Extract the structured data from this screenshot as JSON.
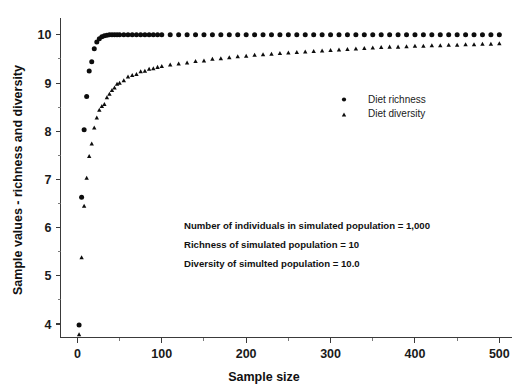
{
  "chart_data": {
    "type": "scatter",
    "title": "",
    "xlabel": "Sample size",
    "ylabel": "Sample values - richness and diversity",
    "xlim": [
      -20,
      515
    ],
    "ylim": [
      3.72,
      10.35
    ],
    "grid": false,
    "legend_position": "upper-right-inside",
    "x_ticks": [
      0,
      100,
      200,
      300,
      400,
      500
    ],
    "x_tick_labels": [
      "0",
      "100",
      "200",
      "300",
      "400",
      "500"
    ],
    "x_minor_ticks": [
      50,
      150,
      250,
      350,
      450
    ],
    "y_ticks": [
      4,
      5,
      6,
      7,
      8,
      9,
      10
    ],
    "y_tick_labels": [
      "4",
      "5",
      "6",
      "7",
      "8",
      "9",
      "10"
    ],
    "y_minor_ticks": [
      4.5,
      5.5,
      6.5,
      7.5,
      8.5,
      9.5
    ],
    "series": [
      {
        "name": "Diet richness",
        "marker": "circle",
        "color": "#0d0d0d",
        "x": [
          2,
          5,
          8,
          11,
          14,
          17,
          20,
          23,
          26,
          29,
          32,
          35,
          38,
          41,
          44,
          47,
          50,
          55,
          60,
          65,
          70,
          75,
          80,
          85,
          90,
          95,
          100,
          110,
          120,
          130,
          140,
          150,
          160,
          170,
          180,
          190,
          200,
          210,
          220,
          230,
          240,
          250,
          260,
          270,
          280,
          290,
          300,
          310,
          320,
          330,
          340,
          350,
          360,
          370,
          380,
          390,
          400,
          410,
          420,
          430,
          440,
          450,
          460,
          470,
          480,
          490,
          500
        ],
        "y": [
          3.98,
          6.63,
          8.03,
          8.72,
          9.25,
          9.44,
          9.71,
          9.85,
          9.92,
          9.96,
          9.98,
          9.99,
          10.0,
          10.0,
          10.0,
          10.0,
          10.0,
          10.0,
          10.0,
          10.0,
          10.0,
          10.0,
          10.0,
          10.0,
          10.0,
          10.0,
          10.0,
          10.0,
          10.0,
          10.0,
          10.0,
          10.0,
          10.0,
          10.0,
          10.0,
          10.0,
          10.0,
          10.0,
          10.0,
          10.0,
          10.0,
          10.0,
          10.0,
          10.0,
          10.0,
          10.0,
          10.0,
          10.0,
          10.0,
          10.0,
          10.0,
          10.0,
          10.0,
          10.0,
          10.0,
          10.0,
          10.0,
          10.0,
          10.0,
          10.0,
          10.0,
          10.0,
          10.0,
          10.0,
          10.0,
          10.0,
          10.0
        ]
      },
      {
        "name": "Diet diversity",
        "marker": "triangle",
        "color": "#0d0d0d",
        "x": [
          2,
          5,
          8,
          11,
          14,
          17,
          20,
          23,
          26,
          29,
          32,
          35,
          38,
          41,
          44,
          47,
          50,
          55,
          60,
          65,
          70,
          75,
          80,
          85,
          90,
          95,
          100,
          110,
          120,
          130,
          140,
          150,
          160,
          170,
          180,
          190,
          200,
          210,
          220,
          230,
          240,
          250,
          260,
          270,
          280,
          290,
          300,
          310,
          320,
          330,
          340,
          350,
          360,
          370,
          380,
          390,
          400,
          410,
          420,
          430,
          440,
          450,
          460,
          470,
          480,
          490,
          500
        ],
        "y": [
          3.78,
          5.38,
          6.45,
          7.03,
          7.48,
          7.74,
          8.07,
          8.28,
          8.44,
          8.52,
          8.56,
          8.7,
          8.77,
          8.85,
          8.9,
          8.98,
          9.0,
          9.05,
          9.13,
          9.16,
          9.18,
          9.24,
          9.25,
          9.29,
          9.3,
          9.33,
          9.35,
          9.38,
          9.4,
          9.42,
          9.45,
          9.46,
          9.5,
          9.51,
          9.53,
          9.55,
          9.56,
          9.58,
          9.59,
          9.6,
          9.62,
          9.63,
          9.64,
          9.65,
          9.66,
          9.67,
          9.68,
          9.69,
          9.7,
          9.71,
          9.72,
          9.73,
          9.74,
          9.75,
          9.75,
          9.76,
          9.77,
          9.77,
          9.78,
          9.78,
          9.79,
          9.79,
          9.8,
          9.8,
          9.81,
          9.81,
          9.82
        ]
      }
    ],
    "annotations": [
      "Number of individuals in simulated population  = 1,000",
      "Richness of simulated population = 10",
      "Diversity of simulted population = 10.0"
    ]
  },
  "legend": {
    "items": [
      {
        "label": "Diet richness",
        "marker": "circle"
      },
      {
        "label": "Diet diversity",
        "marker": "triangle"
      }
    ]
  }
}
